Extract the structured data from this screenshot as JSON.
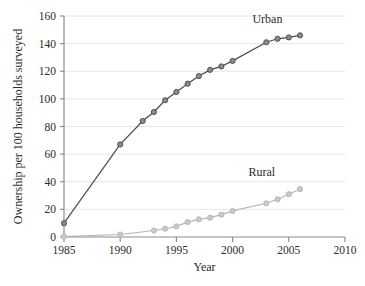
{
  "figure": {
    "background_color": "#ffffff",
    "caption_partial": ""
  },
  "chart_data": {
    "type": "line",
    "title": "",
    "xlabel": "Year",
    "ylabel": "Ownership per 100 households surveyed",
    "xlim": [
      1985,
      2010
    ],
    "ylim": [
      0,
      160
    ],
    "xticks": [
      1985,
      1990,
      1995,
      2000,
      2005,
      2010
    ],
    "yticks": [
      0,
      20,
      40,
      60,
      80,
      100,
      120,
      140,
      160
    ],
    "grid": "horizontal",
    "legend_position": "inline-annotation",
    "series": [
      {
        "name": "Urban",
        "color": "#8a8a8a",
        "line_color": "#4a4a4a",
        "x": [
          1985,
          1990,
          1992,
          1993,
          1994,
          1995,
          1996,
          1997,
          1998,
          1999,
          2000,
          2003,
          2004,
          2005,
          2006
        ],
        "values": [
          10,
          67,
          84,
          90.5,
          99,
          105,
          111,
          116.5,
          121,
          123.5,
          127.5,
          141,
          143.5,
          144.5,
          146
        ]
      },
      {
        "name": "Rural",
        "color": "#c9c9c9",
        "line_color": "#b5b5b5",
        "x": [
          1985,
          1990,
          1993,
          1994,
          1995,
          1996,
          1997,
          1998,
          1999,
          2000,
          2003,
          2004,
          2005,
          2006
        ],
        "values": [
          0.3,
          1.8,
          4.7,
          6,
          7.7,
          10.8,
          12.8,
          14,
          16.2,
          18.9,
          24.4,
          27.3,
          31,
          34.7
        ]
      }
    ],
    "annotations": [
      {
        "text": "Urban",
        "x": 2003.1,
        "y": 155
      },
      {
        "text": "Rural",
        "x": 2002.6,
        "y": 44
      }
    ]
  }
}
